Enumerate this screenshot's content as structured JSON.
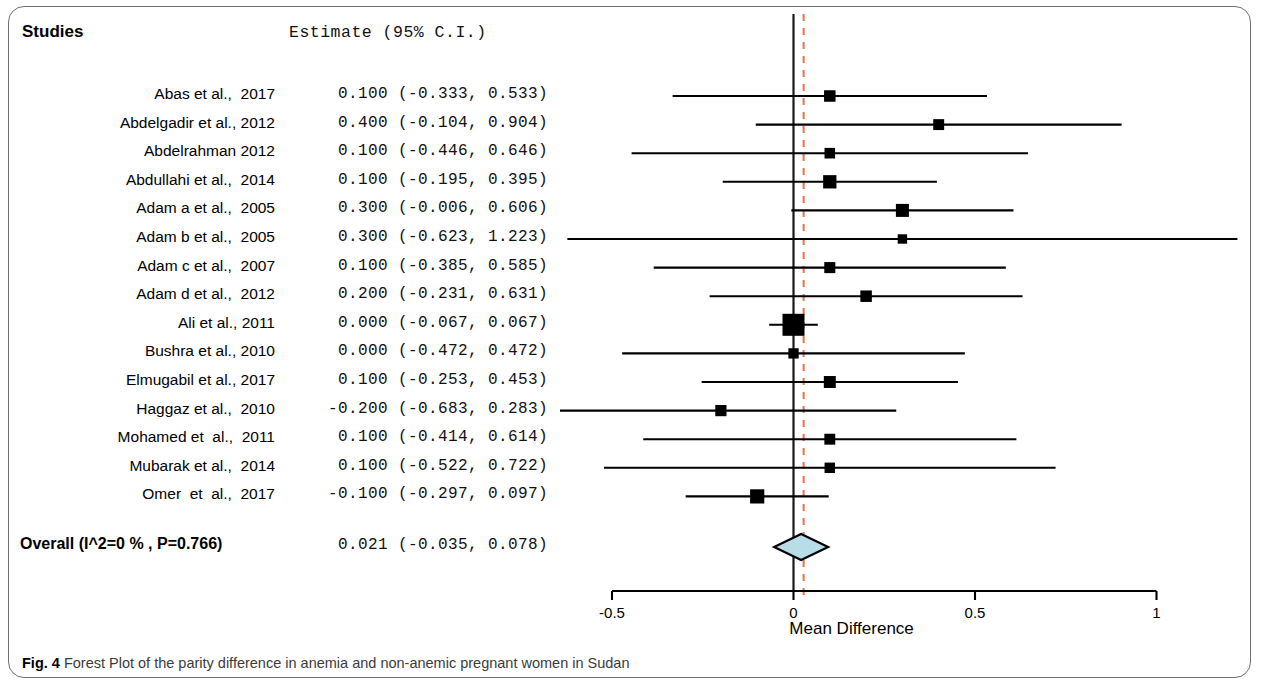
{
  "figure": {
    "caption_prefix": "Fig. 4",
    "caption_text": "Forest Plot of the parity difference in anemia and non-anemic pregnant women in Sudan"
  },
  "columns": {
    "studies_header": "Studies",
    "estimate_header": "Estimate (95% C.I.)"
  },
  "axis": {
    "title": "Mean Difference",
    "ticks": [
      "-0.5",
      "0",
      "0.5",
      "1"
    ],
    "tick_values": [
      -0.5,
      0,
      0.5,
      1
    ]
  },
  "colors": {
    "marker": "#000000",
    "null_line": "#1a1a1a",
    "pooled_line": "#e07a5a",
    "diamond_fill": "#b9dce9",
    "diamond_stroke": "#000000",
    "frame": "#6f6f6f",
    "caption": "#3b3b3b"
  },
  "chart_data": {
    "type": "forest",
    "title": "Forest Plot of the parity difference in anemia and non-anemic pregnant women in Sudan",
    "xlabel": "Mean Difference",
    "ylabel": "",
    "xlim": [
      -0.75,
      1.12
    ],
    "xticks": [
      -0.5,
      0,
      0.5,
      1
    ],
    "grid": false,
    "null_value": 0,
    "pooled_line_value": 0.021,
    "categories": [
      "Abas et al.,  2017",
      "Abdelgadir et al., 2012",
      "Abdelrahman 2012",
      "Abdullahi et al.,  2014",
      "Adam a et al.,  2005",
      "Adam b et al.,  2005",
      "Adam c et al.,  2007",
      "Adam d et al.,  2012",
      "Ali et al., 2011",
      "Bushra et al., 2010",
      " Elmugabil et al., 2017",
      "Haggaz et al.,  2010",
      "Mohamed et  al.,  2011",
      " Mubarak et al.,  2014",
      "Omer  et  al.,  2017"
    ],
    "studies": [
      {
        "label": "Abas et al.,  2017",
        "estimate": 0.1,
        "ci_low": -0.333,
        "ci_high": 0.533,
        "text": "0.100 (-0.333, 0.533)",
        "weight": 0.3
      },
      {
        "label": "Abdelgadir et al., 2012",
        "estimate": 0.4,
        "ci_low": -0.104,
        "ci_high": 0.904,
        "text": "0.400 (-0.104, 0.904)",
        "weight": 0.26
      },
      {
        "label": "Abdelrahman 2012",
        "estimate": 0.1,
        "ci_low": -0.446,
        "ci_high": 0.646,
        "text": "0.100 (-0.446, 0.646)",
        "weight": 0.24
      },
      {
        "label": "Abdullahi et al.,  2014",
        "estimate": 0.1,
        "ci_low": -0.195,
        "ci_high": 0.395,
        "text": "0.100 (-0.195, 0.395)",
        "weight": 0.42
      },
      {
        "label": "Adam a et al.,  2005",
        "estimate": 0.3,
        "ci_low": -0.006,
        "ci_high": 0.606,
        "text": "0.300 (-0.006, 0.606)",
        "weight": 0.4
      },
      {
        "label": "Adam b et al.,  2005",
        "estimate": 0.3,
        "ci_low": -0.623,
        "ci_high": 1.223,
        "text": "0.300 (-0.623, 1.223)",
        "weight": 0.16
      },
      {
        "label": "Adam c et al.,  2007",
        "estimate": 0.1,
        "ci_low": -0.385,
        "ci_high": 0.585,
        "text": "0.100 (-0.385, 0.585)",
        "weight": 0.27
      },
      {
        "label": "Adam d et al.,  2012",
        "estimate": 0.2,
        "ci_low": -0.231,
        "ci_high": 0.631,
        "text": "0.200 (-0.231, 0.631)",
        "weight": 0.3
      },
      {
        "label": "Ali et al., 2011",
        "estimate": 0.0,
        "ci_low": -0.067,
        "ci_high": 0.067,
        "text": "0.000 (-0.067, 0.067)",
        "weight": 1.0
      },
      {
        "label": "Bushra et al., 2010",
        "estimate": 0.0,
        "ci_low": -0.472,
        "ci_high": 0.472,
        "text": "0.000 (-0.472, 0.472)",
        "weight": 0.22
      },
      {
        "label": " Elmugabil et al., 2017",
        "estimate": 0.1,
        "ci_low": -0.253,
        "ci_high": 0.453,
        "text": "0.100 (-0.253, 0.453)",
        "weight": 0.33
      },
      {
        "label": "Haggaz et al.,  2010",
        "estimate": -0.2,
        "ci_low": -0.683,
        "ci_high": 0.283,
        "text": "-0.200 (-0.683, 0.283)",
        "weight": 0.28
      },
      {
        "label": "Mohamed et  al.,  2011",
        "estimate": 0.1,
        "ci_low": -0.414,
        "ci_high": 0.614,
        "text": "0.100 (-0.414, 0.614)",
        "weight": 0.26
      },
      {
        "label": " Mubarak et al.,  2014",
        "estimate": 0.1,
        "ci_low": -0.522,
        "ci_high": 0.722,
        "text": "0.100 (-0.522, 0.722)",
        "weight": 0.23
      },
      {
        "label": "Omer  et  al.,  2017",
        "estimate": -0.1,
        "ci_low": -0.297,
        "ci_high": 0.097,
        "text": "-0.100 (-0.297, 0.097)",
        "weight": 0.48
      }
    ],
    "overall": {
      "label": "Overall (I^2=0 % , P=0.766)",
      "estimate": 0.021,
      "ci_low": -0.035,
      "ci_high": 0.078,
      "text": "0.021 (-0.035, 0.078)",
      "heterogeneity_i2": "0 %",
      "p_value": "0.766"
    }
  }
}
